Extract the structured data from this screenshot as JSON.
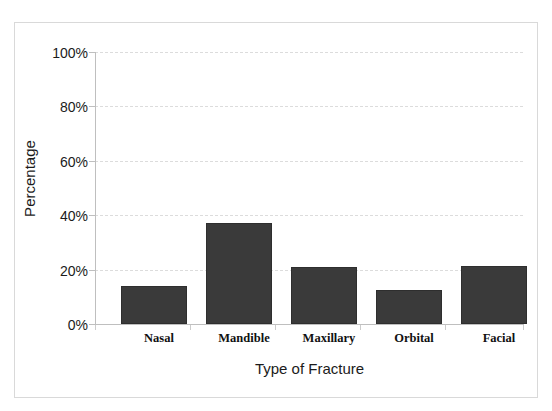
{
  "figure": {
    "ghost_title_fragment": "· · · ·"
  },
  "chart_data": {
    "type": "bar",
    "title": "",
    "xlabel": "Type of Fracture",
    "ylabel": "Percentage",
    "categories": [
      "Nasal",
      "Mandible",
      "Maxillary",
      "Orbital",
      "Facial"
    ],
    "values": [
      14.0,
      37.0,
      21.0,
      12.5,
      21.5
    ],
    "value_labels": [
      "14%",
      "37%",
      "21%",
      "12.5%",
      "21.5%"
    ],
    "ylim": [
      0,
      100
    ],
    "yticks": [
      0,
      20,
      40,
      60,
      80,
      100
    ],
    "ytick_labels": [
      "0%",
      "20%",
      "40%",
      "60%",
      "80%",
      "100%"
    ],
    "grid": true,
    "grid_axis": "y",
    "grid_style": "dashed",
    "legend": false,
    "bar_color": "#3a3a3a",
    "bar_edge_color": "#2e2e2e",
    "grid_color": "#dcdcdc",
    "axis_color": "#bfbfbf",
    "frame_color": "#d9d9d9",
    "background": "#ffffff"
  }
}
